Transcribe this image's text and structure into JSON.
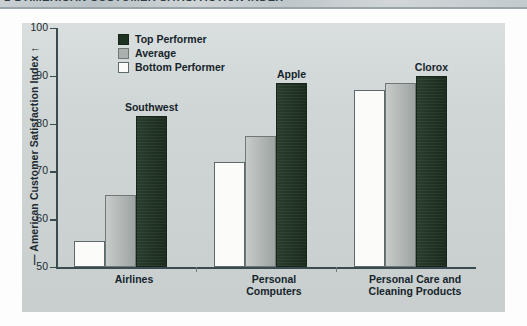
{
  "title": {
    "text": "1-1  AMERICAN CUSTOMER SATISFACTION INDEX"
  },
  "chart_data": {
    "type": "bar",
    "title": "American Customer Satisfaction Index",
    "xlabel": "",
    "ylabel": "American Customer Satisfaction Index",
    "ylim": [
      50,
      100
    ],
    "yticks": [
      50,
      60,
      70,
      80,
      90,
      100
    ],
    "grid": false,
    "legend_position": "top-left",
    "categories": [
      "Airlines",
      "Personal Computers",
      "Personal Care and Cleaning Products"
    ],
    "series": [
      {
        "name": "Bottom Performer",
        "color": "#fbfbfa",
        "values": [
          55.5,
          72.0,
          87.0
        ]
      },
      {
        "name": "Average",
        "color": "#a9b0ae",
        "values": [
          65.0,
          77.5,
          88.5
        ]
      },
      {
        "name": "Top Performer",
        "color": "#1f3322",
        "values": [
          81.5,
          88.5,
          90.0
        ]
      }
    ],
    "annotations": [
      {
        "label": "Southwest",
        "category": "Airlines",
        "series": "Top Performer"
      },
      {
        "label": "Apple",
        "category": "Personal Computers",
        "series": "Top Performer"
      },
      {
        "label": "Clorox",
        "category": "Personal Care and Cleaning Products",
        "series": "Top Performer"
      }
    ]
  },
  "axis": {
    "vertical_title": "American Customer Satisfaction Index",
    "arrow_glyph": "↑",
    "dash_glyph": "—",
    "tick_100": "100",
    "tick_90": "90",
    "tick_80": "80",
    "tick_70": "70",
    "tick_60": "60",
    "tick_50": "50"
  },
  "legend": {
    "items": [
      {
        "label": "Top Performer",
        "swatch": "dark-green"
      },
      {
        "label": "Average",
        "swatch": "gray"
      },
      {
        "label": "Bottom Performer",
        "swatch": "white"
      }
    ]
  },
  "categories_display": [
    {
      "line1": "Airlines",
      "line2": ""
    },
    {
      "line1": "Personal",
      "line2": "Computers"
    },
    {
      "line1": "Personal Care and",
      "line2": "Cleaning Products"
    }
  ],
  "annotations_display": {
    "southwest": "Southwest",
    "apple": "Apple",
    "clorox": "Clorox"
  }
}
